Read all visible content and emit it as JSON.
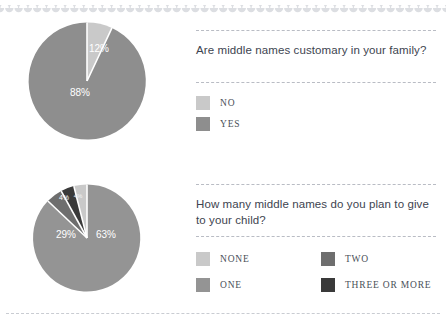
{
  "colors": {
    "none": "#c9c9c9",
    "one": "#949494",
    "two": "#6e6e6e",
    "three_or_more": "#3a3a3a",
    "no": "#c9c9c9",
    "yes": "#8e8e8e",
    "rule": "#b9bcc4",
    "question_text": "#3d4450",
    "legend_text": "#4a4f58",
    "background": "#ffffff"
  },
  "chart_data": [
    {
      "type": "pie",
      "title": "Are middle names customary in your family?",
      "categories": [
        "NO",
        "YES"
      ],
      "values": [
        12,
        88
      ],
      "data_labels": [
        "12%",
        "88%"
      ],
      "colors": [
        "#c9c9c9",
        "#8e8e8e"
      ],
      "legend_position": "right",
      "units": "percent",
      "start_angle_deg": 0,
      "direction": "clockwise"
    },
    {
      "type": "pie",
      "title": "How many middle names do you plan to give to your child?",
      "categories": [
        "NONE",
        "ONE",
        "TWO",
        "THREE OR MORE"
      ],
      "values": [
        4,
        63,
        29,
        4
      ],
      "data_labels": [
        "4%",
        "63%",
        "29%",
        "4%"
      ],
      "colors": [
        "#c9c9c9",
        "#949494",
        "#6e6e6e",
        "#3a3a3a"
      ],
      "legend_position": "right",
      "units": "percent",
      "start_angle_deg": 0,
      "direction": "clockwise",
      "slice_order_clockwise_from_top": [
        "ONE",
        "TWO",
        "THREE OR MORE",
        "NONE"
      ]
    }
  ],
  "blocks": [
    {
      "question": "Are middle names customary in your family?",
      "slices": [
        {
          "label": "12%",
          "value": 12
        },
        {
          "label": "88%",
          "value": 88
        }
      ],
      "legend": [
        {
          "label": "NO",
          "color": "#c9c9c9"
        },
        {
          "label": "YES",
          "color": "#8e8e8e"
        }
      ]
    },
    {
      "question": "How many middle names do you plan to give to your child?",
      "slices": [
        {
          "label": "63%",
          "value": 63
        },
        {
          "label": "29%",
          "value": 29
        },
        {
          "label": "4%",
          "value": 4
        },
        {
          "label": "4%",
          "value": 4
        }
      ],
      "legend": [
        {
          "label": "NONE",
          "color": "#c9c9c9"
        },
        {
          "label": "TWO",
          "color": "#6e6e6e"
        },
        {
          "label": "ONE",
          "color": "#949494"
        },
        {
          "label": "THREE OR MORE",
          "color": "#3a3a3a"
        }
      ]
    }
  ]
}
